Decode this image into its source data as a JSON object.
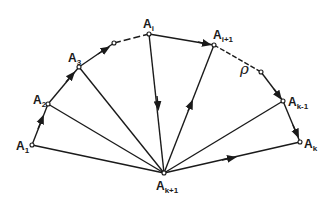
{
  "diagram": {
    "title": "",
    "colors": {
      "stroke": "#1a1a1a",
      "background": "#ffffff"
    },
    "nodes": [
      {
        "id": "A1",
        "label": "A",
        "subscript": "1",
        "x": 32,
        "y": 145,
        "lx": 16,
        "ly": 150
      },
      {
        "id": "A2",
        "label": "A",
        "subscript": "2",
        "x": 48,
        "y": 104,
        "lx": 32,
        "ly": 104
      },
      {
        "id": "A3",
        "label": "A",
        "subscript": "3",
        "x": 79,
        "y": 67,
        "lx": 68,
        "ly": 63
      },
      {
        "id": "P1",
        "label": "",
        "subscript": "",
        "x": 114,
        "y": 43
      },
      {
        "id": "Ai",
        "label": "A",
        "subscript": "i",
        "x": 149,
        "y": 34,
        "lx": 143,
        "ly": 28
      },
      {
        "id": "Ai1",
        "label": "A",
        "subscript": "i+1",
        "x": 214,
        "y": 45,
        "lx": 213,
        "ly": 39
      },
      {
        "id": "P2",
        "label": "",
        "subscript": "",
        "x": 261,
        "y": 72
      },
      {
        "id": "Ak1",
        "label": "A",
        "subscript": "k-1",
        "x": 283,
        "y": 101,
        "lx": 288,
        "ly": 106
      },
      {
        "id": "Ak",
        "label": "A",
        "subscript": "k",
        "x": 300,
        "y": 142,
        "lx": 304,
        "ly": 148
      },
      {
        "id": "Ak2",
        "label": "A",
        "subscript": "k+1",
        "x": 164,
        "y": 173,
        "lx": 156,
        "ly": 192
      }
    ],
    "labels": {
      "A1": "A",
      "A1_sub": "1",
      "A2": "A",
      "A2_sub": "2",
      "A3": "A",
      "A3_sub": "3",
      "Ai": "A",
      "Ai_sub": "i",
      "Ai1": "A",
      "Ai1_sub": "i+1",
      "Ak1": "A",
      "Ak1_sub": "k-1",
      "Ak": "A",
      "Ak_sub": "k",
      "Ak2": "A",
      "Ak2_sub": "k+1",
      "rho": "ρ"
    },
    "edges": {
      "boundary_solid": [
        [
          "A1",
          "A2",
          "arrow"
        ],
        [
          "A2",
          "A3",
          "arrow"
        ],
        [
          "A3",
          "P1",
          "arrow"
        ],
        [
          "Ai",
          "Ai1",
          "arrow"
        ],
        [
          "P2",
          "Ak1",
          "none"
        ],
        [
          "Ak1",
          "Ak",
          "arrow"
        ]
      ],
      "boundary_dashed": [
        [
          "P1",
          "Ai"
        ],
        [
          "Ai1",
          "P2"
        ]
      ],
      "spokes": [
        [
          "A1",
          "Ak2",
          "none"
        ],
        [
          "A2",
          "Ak2",
          "none"
        ],
        [
          "A3",
          "Ak2",
          "none"
        ],
        [
          "Ai",
          "Ak2",
          "arrow-down"
        ],
        [
          "Ak2",
          "Ai1",
          "arrow-up"
        ],
        [
          "Ak1",
          "Ak2",
          "none"
        ],
        [
          "Ak2",
          "Ak",
          "arrow"
        ]
      ]
    },
    "annotation": {
      "symbol": "ρ",
      "x": 241,
      "y": 73
    }
  }
}
